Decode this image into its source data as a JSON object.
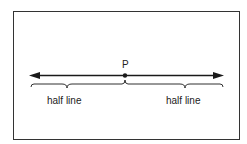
{
  "diagram": {
    "title": "",
    "point_label": "P",
    "left_label": "half line",
    "right_label": "half line",
    "colors": {
      "ink": "#1a1a1a",
      "frame": "#333333",
      "background": "#ffffff"
    }
  }
}
